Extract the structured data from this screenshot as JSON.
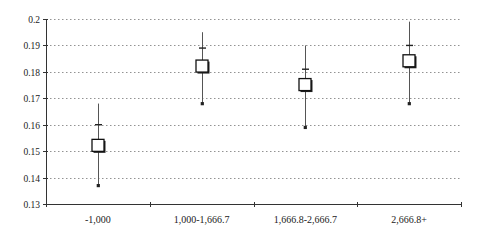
{
  "chart_data": {
    "type": "scatter",
    "subtype": "error-bar / high-low-close with box markers",
    "title": "",
    "xlabel": "",
    "ylabel": "",
    "categories": [
      "-1,000",
      "1,000-1,666.7",
      "1,666.8-2,666.7",
      "2,666.8+"
    ],
    "series": [
      {
        "name": "point_estimate",
        "values": [
          0.152,
          0.182,
          0.175,
          0.184
        ]
      },
      {
        "name": "upper_cap",
        "values": [
          0.16,
          0.189,
          0.181,
          0.19
        ]
      },
      {
        "name": "whisker_high",
        "values": [
          0.168,
          0.195,
          0.19,
          0.199
        ]
      },
      {
        "name": "whisker_low_marker",
        "values": [
          0.137,
          0.168,
          0.159,
          0.168
        ]
      }
    ],
    "ylim": [
      0.13,
      0.2
    ],
    "yticks": [
      "0.13",
      "0.14",
      "0.15",
      "0.16",
      "0.17",
      "0.18",
      "0.19",
      "0.2"
    ],
    "grid": {
      "horizontal": true,
      "style": "dotted"
    },
    "legend": null
  }
}
